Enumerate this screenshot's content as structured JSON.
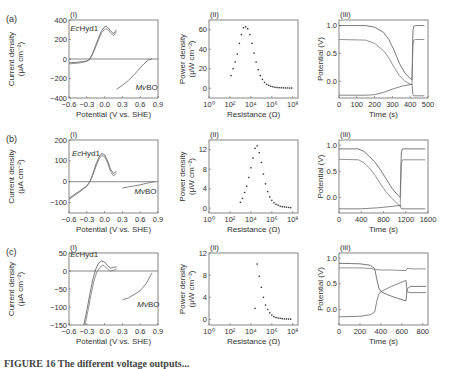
{
  "caption": "FIGURE 16  The different voltage outputs...",
  "rows": [
    {
      "label": "(a)"
    },
    {
      "label": "(b)"
    },
    {
      "label": "(c)"
    }
  ],
  "chart_data": [
    {
      "id": "a-i",
      "row": "(a)",
      "panel": "(i)",
      "type": "line",
      "xlabel": "Potential (V vs. SHE)",
      "ylabel": "Current density (μA cm⁻²)",
      "xlim": [
        -0.6,
        0.9
      ],
      "ylim": [
        -400,
        400
      ],
      "xticks": [
        -0.6,
        -0.3,
        0.0,
        0.3,
        0.6,
        0.9
      ],
      "xticklabels": [
        "−0.6",
        "−0.3",
        "0.0",
        "0.3",
        "0.6",
        "0.9"
      ],
      "yticks": [
        -400,
        -200,
        0,
        200,
        400
      ],
      "yticklabels": [
        "−400",
        "−200",
        "0",
        "200",
        "400"
      ],
      "zero_line": true,
      "annotations": [
        {
          "text": "EcHyd1",
          "italic_prefix": "Ec",
          "x": -0.58,
          "y": 290
        },
        {
          "text": "MvBO",
          "italic_prefix": "Mv",
          "x": 0.52,
          "y": -320
        }
      ],
      "series": [
        {
          "name": "EcHyd1 forward",
          "x": [
            -0.6,
            -0.5,
            -0.4,
            -0.3,
            -0.25,
            -0.2,
            -0.15,
            -0.1,
            -0.05,
            0.0,
            0.03,
            0.06,
            0.1,
            0.15,
            0.2
          ],
          "y": [
            -40,
            -35,
            -30,
            -20,
            0,
            60,
            140,
            220,
            290,
            330,
            335,
            320,
            290,
            260,
            300
          ]
        },
        {
          "name": "EcHyd1 reverse",
          "x": [
            -0.6,
            -0.5,
            -0.4,
            -0.3,
            -0.25,
            -0.2,
            -0.15,
            -0.1,
            -0.05,
            0.0,
            0.03,
            0.06,
            0.1,
            0.15,
            0.2
          ],
          "y": [
            -50,
            -45,
            -38,
            -25,
            -5,
            50,
            125,
            200,
            270,
            305,
            310,
            300,
            270,
            240,
            280
          ]
        },
        {
          "name": "MvBO",
          "x": [
            0.2,
            0.3,
            0.4,
            0.5,
            0.6,
            0.7,
            0.75,
            0.8
          ],
          "y": [
            -310,
            -270,
            -220,
            -160,
            -90,
            -30,
            -5,
            0
          ]
        }
      ]
    },
    {
      "id": "a-ii",
      "row": "(a)",
      "panel": "(ii)",
      "type": "scatter",
      "xlabel": "Resistance (Ω)",
      "ylabel": "Power density (μW cm⁻²)",
      "xscale": "log",
      "xlim_log10": [
        0,
        8.5
      ],
      "ylim": [
        -10,
        70
      ],
      "xticks_log10": [
        0,
        2,
        4,
        6,
        8
      ],
      "xticklabels": [
        "10⁰",
        "10²",
        "10⁴",
        "10⁶",
        "10⁸"
      ],
      "yticks": [
        0,
        20,
        40,
        60
      ],
      "yticklabels": [
        "0",
        "20",
        "40",
        "60"
      ],
      "series": [
        {
          "name": "power",
          "log10x": [
            2.1,
            2.3,
            2.5,
            2.7,
            2.9,
            3.1,
            3.3,
            3.5,
            3.7,
            3.9,
            4.1,
            4.3,
            4.5,
            4.7,
            4.9,
            5.1,
            5.3,
            5.5,
            5.7,
            5.9,
            6.1,
            6.3,
            6.5,
            6.7,
            6.9,
            7.1,
            7.3,
            7.5,
            7.7,
            7.9
          ],
          "y": [
            13,
            20,
            27,
            35,
            46,
            55,
            62,
            63,
            61,
            55,
            46,
            36,
            27,
            19,
            13,
            9,
            6,
            4,
            3,
            2,
            1.5,
            1,
            0.8,
            0.6,
            0.5,
            0.4,
            0.3,
            0.3,
            0.2,
            0.2
          ]
        }
      ]
    },
    {
      "id": "a-iii",
      "row": "(a)",
      "panel": "(iii)",
      "type": "line",
      "xlabel": "Time (s)",
      "ylabel": "Potential (V)",
      "xlim": [
        0,
        500
      ],
      "ylim": [
        -0.3,
        1.1
      ],
      "xticks": [
        0,
        100,
        200,
        300,
        400,
        500
      ],
      "xticklabels": [
        "0",
        "100",
        "200",
        "300",
        "400",
        "500"
      ],
      "yticks": [
        0.0,
        0.5,
        1.0
      ],
      "yticklabels": [
        "0.0",
        "0.5",
        "1.0"
      ],
      "series": [
        {
          "name": "cell",
          "x": [
            0,
            150,
            200,
            250,
            280,
            310,
            340,
            370,
            400,
            410,
            415,
            420,
            430,
            480
          ],
          "y": [
            1.0,
            1.0,
            0.97,
            0.88,
            0.75,
            0.55,
            0.32,
            0.15,
            0.05,
            0.03,
            0.9,
            0.99,
            1.0,
            1.0
          ]
        },
        {
          "name": "cathode",
          "x": [
            0,
            150,
            200,
            250,
            280,
            310,
            340,
            370,
            400,
            410,
            415,
            420,
            430,
            480
          ],
          "y": [
            0.75,
            0.74,
            0.68,
            0.55,
            0.42,
            0.25,
            0.1,
            0.0,
            -0.05,
            -0.06,
            0.65,
            0.74,
            0.75,
            0.75
          ]
        },
        {
          "name": "anode",
          "x": [
            0,
            150,
            200,
            250,
            300,
            350,
            400,
            410,
            415,
            420,
            480
          ],
          "y": [
            -0.25,
            -0.25,
            -0.24,
            -0.2,
            -0.14,
            -0.09,
            -0.06,
            -0.05,
            -0.24,
            -0.26,
            -0.26
          ]
        }
      ]
    },
    {
      "id": "b-i",
      "row": "(b)",
      "panel": "(i)",
      "type": "line",
      "xlabel": "Potential (V vs. SHE)",
      "ylabel": "Current density (μA cm⁻²)",
      "xlim": [
        -0.6,
        0.9
      ],
      "ylim": [
        -150,
        200
      ],
      "xticks": [
        -0.6,
        -0.3,
        0.0,
        0.3,
        0.6,
        0.9
      ],
      "xticklabels": [
        "−0.6",
        "−0.3",
        "0.0",
        "0.3",
        "0.6",
        "0.9"
      ],
      "yticks": [
        -100,
        0,
        100,
        200
      ],
      "yticklabels": [
        "−100",
        "0",
        "100",
        "200"
      ],
      "zero_line": true,
      "annotations": [
        {
          "text": "EcHyd1",
          "italic_prefix": "Ec",
          "x": -0.55,
          "y": 125
        },
        {
          "text": "MvBO",
          "italic_prefix": "Mv",
          "x": 0.5,
          "y": -60
        }
      ],
      "series": [
        {
          "name": "EcHyd1 forward",
          "x": [
            -0.6,
            -0.5,
            -0.4,
            -0.3,
            -0.25,
            -0.2,
            -0.15,
            -0.1,
            -0.05,
            0.0,
            0.05,
            0.1,
            0.15,
            0.2
          ],
          "y": [
            -80,
            -60,
            -40,
            -20,
            0,
            35,
            80,
            115,
            135,
            130,
            100,
            60,
            40,
            50
          ]
        },
        {
          "name": "EcHyd1 reverse",
          "x": [
            -0.6,
            -0.5,
            -0.4,
            -0.3,
            -0.25,
            -0.2,
            -0.15,
            -0.1,
            -0.05,
            0.0,
            0.05,
            0.1,
            0.15,
            0.2
          ],
          "y": [
            -85,
            -65,
            -45,
            -22,
            -2,
            30,
            70,
            105,
            125,
            120,
            90,
            50,
            28,
            40
          ]
        },
        {
          "name": "MvBO",
          "x": [
            0.3,
            0.4,
            0.5,
            0.6,
            0.7,
            0.8,
            0.85
          ],
          "y": [
            -30,
            -25,
            -20,
            -15,
            -8,
            -2,
            0
          ]
        }
      ]
    },
    {
      "id": "b-ii",
      "row": "(b)",
      "panel": "(ii)",
      "type": "scatter",
      "xlabel": "Resistance (Ω)",
      "ylabel": "Power density (μW cm⁻²)",
      "xscale": "log",
      "xlim_log10": [
        0,
        8.5
      ],
      "ylim": [
        -1,
        14
      ],
      "xticks_log10": [
        0,
        2,
        4,
        6,
        8
      ],
      "xticklabels": [
        "10⁰",
        "10²",
        "10⁴",
        "10⁶",
        "10⁸"
      ],
      "yticks": [
        0,
        4,
        8,
        12
      ],
      "yticklabels": [
        "0",
        "4",
        "8",
        "12"
      ],
      "series": [
        {
          "name": "power",
          "log10x": [
            3.0,
            3.2,
            3.4,
            3.6,
            3.8,
            4.0,
            4.2,
            4.4,
            4.6,
            4.8,
            5.0,
            5.2,
            5.4,
            5.6,
            5.8,
            6.0,
            6.2,
            6.4,
            6.6,
            6.8,
            7.0,
            7.2,
            7.4,
            7.6,
            7.8
          ],
          "y": [
            1.2,
            2,
            3.2,
            4.5,
            6.3,
            8.3,
            10.3,
            12.3,
            12.8,
            11.4,
            9.4,
            7,
            5,
            3.4,
            2.3,
            1.6,
            1.1,
            0.8,
            0.6,
            0.4,
            0.3,
            0.25,
            0.2,
            0.15,
            0.1
          ]
        }
      ]
    },
    {
      "id": "b-iii",
      "row": "(b)",
      "panel": "(iii)",
      "type": "line",
      "xlabel": "Time (s)",
      "ylabel": "Potential (V)",
      "xlim": [
        0,
        1600
      ],
      "ylim": [
        -0.3,
        1.1
      ],
      "xticks": [
        0,
        400,
        800,
        1200,
        1600
      ],
      "xticklabels": [
        "0",
        "400",
        "800",
        "1200",
        "1600"
      ],
      "yticks": [
        0.0,
        0.5,
        1.0
      ],
      "yticklabels": [
        "0.0",
        "0.5",
        "1.0"
      ],
      "series": [
        {
          "name": "cell",
          "x": [
            0,
            350,
            450,
            550,
            650,
            750,
            850,
            950,
            1050,
            1100,
            1120,
            1140,
            1200,
            1550
          ],
          "y": [
            0.93,
            0.93,
            0.88,
            0.78,
            0.67,
            0.52,
            0.35,
            0.18,
            0.05,
            0.0,
            0.85,
            0.93,
            0.93,
            0.93
          ]
        },
        {
          "name": "cathode",
          "x": [
            0,
            350,
            450,
            550,
            650,
            750,
            850,
            950,
            1050,
            1100,
            1120,
            1140,
            1200,
            1550
          ],
          "y": [
            0.73,
            0.72,
            0.66,
            0.56,
            0.42,
            0.25,
            0.1,
            -0.02,
            -0.12,
            -0.18,
            0.65,
            0.72,
            0.72,
            0.72
          ]
        },
        {
          "name": "anode",
          "x": [
            0,
            400,
            700,
            900,
            1050,
            1100,
            1120,
            1200,
            1550
          ],
          "y": [
            -0.22,
            -0.22,
            -0.2,
            -0.18,
            -0.16,
            -0.15,
            -0.22,
            -0.22,
            -0.22
          ]
        }
      ]
    },
    {
      "id": "c-i",
      "row": "(c)",
      "panel": "(i)",
      "type": "line",
      "xlabel": "Potential (V vs. SHE)",
      "ylabel": "Current density (μA cm⁻²)",
      "xlim": [
        -0.6,
        0.9
      ],
      "ylim": [
        -150,
        50
      ],
      "xticks": [
        -0.6,
        -0.3,
        0.0,
        0.3,
        0.6,
        0.9
      ],
      "xticklabels": [
        "−0.6",
        "−0.3",
        "0.0",
        "0.3",
        "0.6",
        "0.9"
      ],
      "yticks": [
        -150,
        -100,
        -50,
        0,
        50
      ],
      "yticklabels": [
        "−150",
        "−100",
        "−50",
        "0",
        "50"
      ],
      "zero_line": true,
      "annotations": [
        {
          "text": "EcHyd1",
          "italic_prefix": "Ec",
          "x": -0.58,
          "y": 38
        },
        {
          "text": "MvBO",
          "italic_prefix": "Mv",
          "x": 0.55,
          "y": -100
        }
      ],
      "series": [
        {
          "name": "EcHyd1 forward",
          "x": [
            -0.35,
            -0.3,
            -0.25,
            -0.2,
            -0.15,
            -0.1,
            -0.05,
            0.0,
            0.05,
            0.1,
            0.15,
            0.2
          ],
          "y": [
            -150,
            -110,
            -65,
            -25,
            5,
            22,
            28,
            25,
            15,
            8,
            10,
            12
          ]
        },
        {
          "name": "EcHyd1 reverse",
          "x": [
            -0.33,
            -0.28,
            -0.23,
            -0.18,
            -0.13,
            -0.08,
            -0.03,
            0.0,
            0.05,
            0.1,
            0.15,
            0.2
          ],
          "y": [
            -150,
            -110,
            -65,
            -28,
            -2,
            10,
            16,
            14,
            5,
            0,
            2,
            6
          ]
        },
        {
          "name": "MvBO",
          "x": [
            0.3,
            0.4,
            0.5,
            0.6,
            0.7,
            0.8
          ],
          "y": [
            -80,
            -75,
            -65,
            -55,
            -35,
            -5
          ]
        }
      ]
    },
    {
      "id": "c-ii",
      "row": "(c)",
      "panel": "(ii)",
      "type": "scatter",
      "xlabel": "Resistance (Ω)",
      "ylabel": "Power density (μW cm⁻²)",
      "xscale": "log",
      "xlim_log10": [
        0,
        8.5
      ],
      "ylim": [
        -1,
        12
      ],
      "xticks_log10": [
        0,
        2,
        4,
        6,
        8
      ],
      "xticklabels": [
        "10⁰",
        "10²",
        "10⁴",
        "10⁶",
        "10⁸"
      ],
      "yticks": [
        0,
        4,
        8,
        12
      ],
      "yticklabels": [
        "0",
        "4",
        "8",
        "12"
      ],
      "series": [
        {
          "name": "power",
          "log10x": [
            4.4,
            4.6,
            4.8,
            5.0,
            5.2,
            5.4,
            5.6,
            5.8,
            6.0,
            6.2,
            6.4,
            6.6,
            6.8,
            7.0,
            7.2,
            7.4,
            7.6,
            7.8
          ],
          "y": [
            2,
            10,
            7.8,
            5.8,
            4,
            2.6,
            1.8,
            1.2,
            0.8,
            0.5,
            0.35,
            0.25,
            0.2,
            0.15,
            0.1,
            0.1,
            0.08,
            0.05
          ]
        }
      ]
    },
    {
      "id": "c-iii",
      "row": "(c)",
      "panel": "(iii)",
      "type": "line",
      "xlabel": "Time (s)",
      "ylabel": "Potential (V)",
      "xlim": [
        0,
        850
      ],
      "ylim": [
        -0.3,
        1.1
      ],
      "xticks": [
        0,
        200,
        400,
        600,
        800
      ],
      "xticklabels": [
        "0",
        "200",
        "400",
        "600",
        "800"
      ],
      "yticks": [
        0.0,
        0.5,
        1.0
      ],
      "yticklabels": [
        "0.0",
        "0.5",
        "1.0"
      ],
      "series": [
        {
          "name": "cell",
          "x": [
            0,
            200,
            300,
            340,
            360,
            380,
            400,
            450,
            500,
            560,
            620,
            640,
            650,
            680,
            750,
            830
          ],
          "y": [
            0.9,
            0.89,
            0.86,
            0.8,
            0.6,
            0.42,
            0.35,
            0.3,
            0.26,
            0.22,
            0.18,
            0.17,
            0.4,
            0.45,
            0.45,
            0.45
          ]
        },
        {
          "name": "cathode",
          "x": [
            0,
            200,
            300,
            350,
            400,
            500,
            600,
            640,
            650,
            700,
            830
          ],
          "y": [
            0.81,
            0.81,
            0.8,
            0.78,
            0.77,
            0.77,
            0.76,
            0.76,
            0.8,
            0.79,
            0.79
          ]
        },
        {
          "name": "anode",
          "x": [
            0,
            200,
            300,
            340,
            360,
            380,
            400,
            450,
            500,
            560,
            620,
            640,
            650,
            680,
            750,
            830
          ],
          "y": [
            -0.14,
            -0.13,
            -0.1,
            -0.05,
            0.15,
            0.3,
            0.35,
            0.4,
            0.45,
            0.5,
            0.55,
            0.57,
            0.35,
            0.33,
            0.33,
            0.33
          ]
        }
      ]
    }
  ]
}
